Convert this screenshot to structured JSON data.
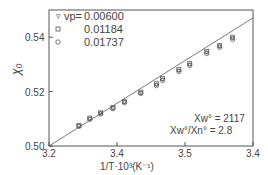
{
  "chart_data": {
    "type": "scatter",
    "title": "",
    "xlabel": "1/T·10³(K⁻¹)",
    "ylabel": "χ₀",
    "xlim": [
      3.2,
      3.5
    ],
    "ylim": [
      0.5,
      0.55
    ],
    "x_tick_labels": [
      "3.2",
      "3.4",
      "3.5",
      "3.4"
    ],
    "y_tick_labels": [
      "0.50",
      "0.52",
      "0.54"
    ],
    "grid": false,
    "legend_position": "upper-left",
    "legend": {
      "prefix": "vp=",
      "entries": [
        {
          "marker": "triangle-down",
          "label": "0.00600"
        },
        {
          "marker": "square",
          "label": "0.01184"
        },
        {
          "marker": "circle",
          "label": "0.01737"
        }
      ]
    },
    "annotations": [
      "Xw° = 2117",
      "Xw°/Xn° = 2.8"
    ],
    "fit_line": {
      "x": [
        3.2,
        3.5
      ],
      "y": [
        0.5,
        0.5471
      ]
    },
    "series": [
      {
        "name": "0.00600",
        "x": [
          3.244,
          3.26,
          3.276,
          3.294,
          3.311,
          3.335,
          3.358,
          3.367,
          3.391,
          3.407,
          3.432,
          3.451,
          3.47
        ],
        "y": [
          0.5074,
          0.51,
          0.512,
          0.5139,
          0.5161,
          0.5195,
          0.5225,
          0.5244,
          0.5277,
          0.5299,
          0.5344,
          0.5366,
          0.5396
        ]
      },
      {
        "name": "0.01184",
        "x": [
          3.244,
          3.26,
          3.276,
          3.294,
          3.311,
          3.335,
          3.358,
          3.367,
          3.391,
          3.407,
          3.432,
          3.451,
          3.47
        ],
        "y": [
          0.5076,
          0.5103,
          0.5122,
          0.5141,
          0.5163,
          0.5198,
          0.5229,
          0.5248,
          0.5281,
          0.5303,
          0.5348,
          0.537,
          0.54
        ]
      },
      {
        "name": "0.01737",
        "x": [
          3.244,
          3.26,
          3.276,
          3.294,
          3.311,
          3.335,
          3.358,
          3.367,
          3.391,
          3.407,
          3.432,
          3.451,
          3.47
        ],
        "y": [
          0.5072,
          0.5098,
          0.5118,
          0.5137,
          0.5159,
          0.5193,
          0.5222,
          0.5241,
          0.5274,
          0.5296,
          0.534,
          0.5363,
          0.5392
        ]
      }
    ]
  }
}
